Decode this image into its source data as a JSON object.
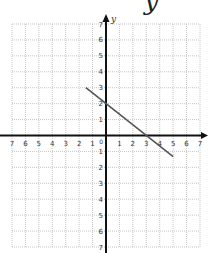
{
  "heading_fragment": "y",
  "chart_data": {
    "type": "line",
    "title": "",
    "xlabel": "",
    "ylabel": "y",
    "xlim": [
      -7,
      7
    ],
    "ylim": [
      -7,
      7
    ],
    "grid": true,
    "x_ticks": [
      -7,
      -6,
      -5,
      -4,
      -3,
      -2,
      -1,
      1,
      2,
      3,
      4,
      5,
      6,
      7
    ],
    "y_ticks": [
      -7,
      -6,
      -5,
      -4,
      -3,
      -2,
      -1,
      1,
      2,
      3,
      4,
      5,
      6,
      7
    ],
    "x_tick_labels": [
      "7",
      "6",
      "5",
      "4",
      "3",
      "2",
      "1",
      "1",
      "2",
      "3",
      "4",
      "5",
      "6",
      "7"
    ],
    "y_tick_labels": [
      "7",
      "6",
      "5",
      "4",
      "3",
      "2",
      "1",
      "1",
      "2",
      "3",
      "4",
      "5",
      "6",
      "7"
    ],
    "origin_label": "0",
    "series": [
      {
        "name": "line",
        "x": [
          -1.5,
          5
        ],
        "y": [
          3,
          -1.33
        ],
        "color": "#555555"
      }
    ],
    "legend": null
  },
  "colors": {
    "axis": "#111111",
    "grid": "#b8b8b8",
    "line": "#555555",
    "tick_text": "#333333"
  }
}
